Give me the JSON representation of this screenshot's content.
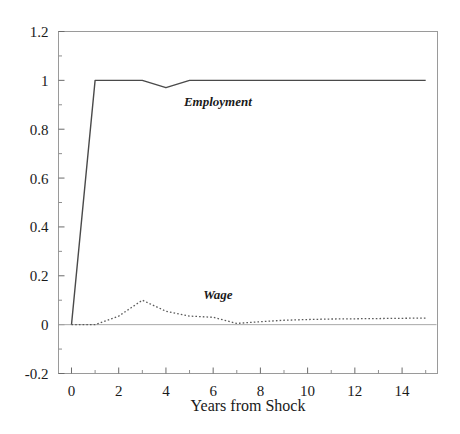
{
  "chart_data": {
    "type": "line",
    "title": "",
    "xlabel": "Years from Shock",
    "ylabel": "",
    "xlim": [
      -0.55,
      15.5
    ],
    "ylim": [
      -0.2,
      1.2
    ],
    "grid": false,
    "legend_position": "inline-annotation",
    "x_ticks": [
      0,
      2,
      4,
      6,
      8,
      10,
      12,
      14
    ],
    "x_tick_labels": [
      "0",
      "2",
      "4",
      "6",
      "8",
      "10",
      "12",
      "14"
    ],
    "x_minor_tick_step": 1,
    "y_ticks": [
      -0.2,
      0,
      0.2,
      0.4,
      0.6,
      0.8,
      1,
      1.2
    ],
    "y_tick_labels": [
      "-0.2",
      "0",
      "0.2",
      "0.4",
      "0.6",
      "0.8",
      "1",
      "1.2"
    ],
    "y_minor_tick_step": 0.1,
    "x": [
      0,
      1,
      2,
      3,
      4,
      5,
      6,
      7,
      8,
      9,
      10,
      11,
      12,
      13,
      14,
      15
    ],
    "series": [
      {
        "name": "Employment",
        "style": "solid",
        "color": "#4a4a4a",
        "label_x": 6.2,
        "label_y": 0.895,
        "values": [
          0.0,
          1.0,
          1.0,
          1.0,
          0.97,
          1.0,
          1.0,
          1.0,
          1.0,
          1.0,
          1.0,
          1.0,
          1.0,
          1.0,
          1.0,
          1.0
        ]
      },
      {
        "name": "Wage",
        "style": "dotted",
        "color": "#5a5a5a",
        "label_x": 6.2,
        "label_y": 0.105,
        "values": [
          0.0,
          0.0,
          0.035,
          0.1,
          0.055,
          0.035,
          0.03,
          0.005,
          0.012,
          0.018,
          0.021,
          0.023,
          0.024,
          0.025,
          0.026,
          0.027
        ]
      }
    ],
    "annotations": [
      {
        "text": "Employment",
        "x": 6.2,
        "y": 0.895
      },
      {
        "text": "Wage",
        "x": 6.2,
        "y": 0.105
      }
    ]
  },
  "figure": {
    "background_color": "#ffffff",
    "frame_color": "#9a9a9a",
    "text_color": "#1a1a1a"
  }
}
